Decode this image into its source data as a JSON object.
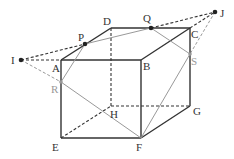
{
  "diagram": {
    "type": "cube-section",
    "colors": {
      "edge": "#333333",
      "hidden_edge": "#333333",
      "section_line": "#999999",
      "construction_line": "#333333",
      "gray_label": "#999999"
    },
    "points": {
      "A": {
        "label": "A",
        "x": 61,
        "y": 60
      },
      "B": {
        "label": "B",
        "x": 141,
        "y": 60
      },
      "C": {
        "label": "C",
        "x": 190,
        "y": 28
      },
      "D": {
        "label": "D",
        "x": 111,
        "y": 28
      },
      "E": {
        "label": "E",
        "x": 61,
        "y": 138
      },
      "F": {
        "label": "F",
        "x": 141,
        "y": 138
      },
      "G": {
        "label": "G",
        "x": 190,
        "y": 106
      },
      "H": {
        "label": "H",
        "x": 111,
        "y": 106
      },
      "I": {
        "label": "I",
        "x": 21,
        "y": 60
      },
      "J": {
        "label": "J",
        "x": 215,
        "y": 12
      },
      "P": {
        "label": "P",
        "x": 85,
        "y": 44
      },
      "Q": {
        "label": "Q",
        "x": 151,
        "y": 28
      },
      "R": {
        "label": "R",
        "x": 61,
        "y": 82
      },
      "S": {
        "label": "S",
        "x": 190,
        "y": 54
      }
    },
    "labels": {
      "A": "A",
      "B": "B",
      "C": "C",
      "D": "D",
      "E": "E",
      "F": "F",
      "G": "G",
      "H": "H",
      "I": "I",
      "J": "J",
      "P": "P",
      "Q": "Q",
      "R": "R",
      "S": "S"
    }
  }
}
